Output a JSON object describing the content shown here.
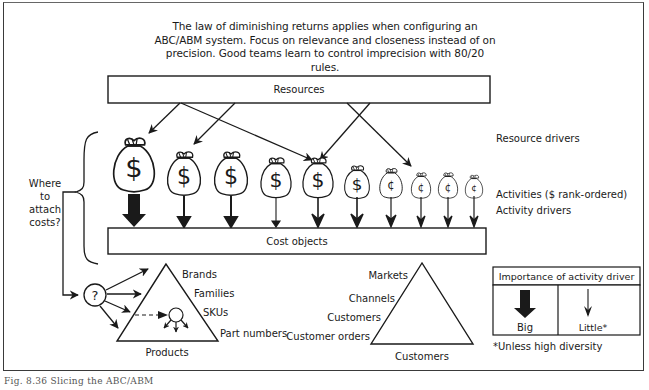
{
  "intro": {
    "line1": "The law of diminishing returns applies when configuring an",
    "line2": "ABC/ABM system.  Focus on relevance and closeness instead of on",
    "line3": "precision.  Good teams learn to control imprecision with 80/20 rules."
  },
  "boxes": {
    "resources": "Resources",
    "cost_objects": "Cost objects"
  },
  "right_labels": {
    "resource_drivers": "Resource drivers",
    "activities": "Activities ($ rank-ordered)",
    "activity_drivers": "Activity drivers"
  },
  "left_question": {
    "line1": "Where",
    "line2": "to",
    "line3": "attach",
    "line4": "costs?"
  },
  "question_mark": "?",
  "activities": [
    {
      "symbol": "$",
      "size": 1.0,
      "driver": "big"
    },
    {
      "symbol": "$",
      "size": 0.82,
      "driver": "medium"
    },
    {
      "symbol": "$",
      "size": 0.82,
      "driver": "medium"
    },
    {
      "symbol": "$",
      "size": 0.76,
      "driver": "thin"
    },
    {
      "symbol": "$",
      "size": 0.76,
      "driver": "open"
    },
    {
      "symbol": "$",
      "size": 0.62,
      "driver": "open"
    },
    {
      "symbol": "¢",
      "size": 0.58,
      "driver": "open"
    },
    {
      "symbol": "¢",
      "size": 0.5,
      "driver": "open"
    },
    {
      "symbol": "¢",
      "size": 0.5,
      "driver": "open"
    },
    {
      "symbol": "¢",
      "size": 0.45,
      "driver": "open"
    }
  ],
  "products": {
    "title": "Products",
    "levels": [
      "Brands",
      "Families",
      "SKUs",
      "Part numbers"
    ]
  },
  "customers": {
    "title": "Customers",
    "levels": [
      "Markets",
      "Channels",
      "Customers",
      "Customer orders"
    ]
  },
  "legend": {
    "title": "Importance of activity driver",
    "big": "Big",
    "little": "Little*",
    "footnote": "*Unless high diversity"
  },
  "caption": "Fig. 8.36 Slicing the ABC/ABM"
}
